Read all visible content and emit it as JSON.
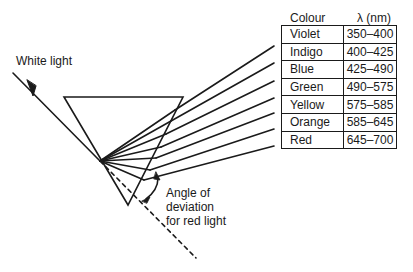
{
  "diagram": {
    "incident_label": "White light",
    "angle_label": [
      "Angle of",
      "deviation",
      "for red light"
    ],
    "table": {
      "headers": {
        "colour": "Colour",
        "wavelength": "λ (nm)"
      },
      "rows": [
        {
          "colour": "Violet",
          "range": "350–400"
        },
        {
          "colour": "Indigo",
          "range": "400–425"
        },
        {
          "colour": "Blue",
          "range": "425–490"
        },
        {
          "colour": "Green",
          "range": "490–575"
        },
        {
          "colour": "Yellow",
          "range": "575–585"
        },
        {
          "colour": "Orange",
          "range": "585–645"
        },
        {
          "colour": "Red",
          "range": "645–700"
        }
      ]
    },
    "line_color": "#1a1a1a"
  }
}
